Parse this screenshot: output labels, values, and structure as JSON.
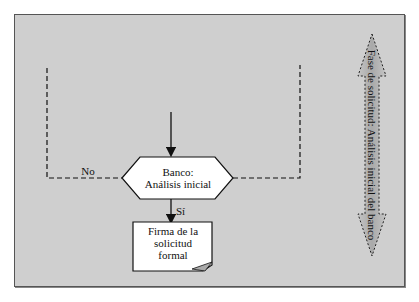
{
  "diagram": {
    "decision": {
      "line1": "Banco:",
      "line2": "Análisis inicial"
    },
    "no_label": "No",
    "yes_label": "Sí",
    "document": {
      "line1": "Firma de la",
      "line2": "solicitud",
      "line3": "formal"
    },
    "phase_label": "Fase de solicitud: Análisis inicial del banco"
  },
  "colors": {
    "background": "#cfcfcf",
    "shape_fill": "#ffffff",
    "arrow_fill": "#b8b8b8",
    "stroke": "#111111"
  }
}
